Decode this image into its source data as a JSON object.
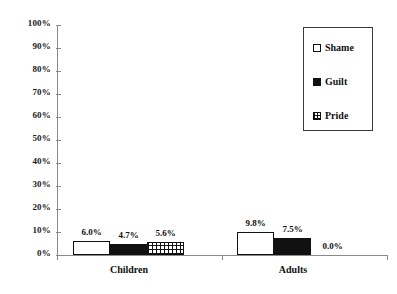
{
  "chart_data": {
    "type": "bar",
    "title": "",
    "subtitle": "",
    "xlabel": "",
    "ylabel": "",
    "categories": [
      "Children",
      "Adults"
    ],
    "series": [
      {
        "name": "Shame",
        "values": [
          6.0,
          9.8
        ],
        "labels": [
          "6.0%",
          "9.8%"
        ],
        "fill": "open"
      },
      {
        "name": "Guilt",
        "values": [
          4.7,
          7.5
        ],
        "labels": [
          "4.7%",
          "7.5%"
        ],
        "fill": "solid"
      },
      {
        "name": "Pride",
        "values": [
          5.6,
          0.0
        ],
        "labels": [
          "5.6%",
          "0.0%"
        ],
        "fill": "cross"
      }
    ],
    "ylim": [
      0,
      100
    ],
    "yticks": [
      0,
      10,
      20,
      30,
      40,
      50,
      60,
      70,
      80,
      90,
      100
    ],
    "ytick_labels": [
      "0%",
      "10%",
      "20%",
      "30%",
      "40%",
      "50%",
      "60%",
      "70%",
      "80%",
      "90%",
      "100%"
    ],
    "grid": false,
    "legend_position": "top-right",
    "legend_entries": [
      "Shame",
      "Guilt",
      "Pride"
    ],
    "colors": {
      "ink": "#111111",
      "axis": "#8a8a8a",
      "background": "#ffffff",
      "shame_fill": "#ffffff",
      "guilt_fill": "#111111",
      "pride_fill": "#ffffff"
    }
  }
}
